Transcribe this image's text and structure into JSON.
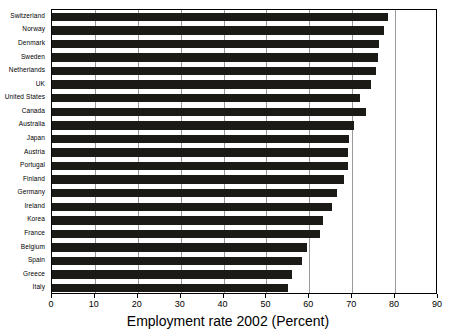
{
  "chart_data": {
    "type": "bar",
    "orientation": "horizontal",
    "title": "",
    "xlabel": "Employment rate 2002 (Percent)",
    "ylabel": "",
    "xlim": [
      0,
      90
    ],
    "xticks": [
      0,
      10,
      20,
      30,
      40,
      50,
      60,
      70,
      80,
      90
    ],
    "xtick_labels": [
      "0",
      "10",
      "20",
      "30",
      "40",
      "50",
      "60",
      "70",
      "80",
      "90"
    ],
    "grid": "vertical",
    "legend": null,
    "bar_color": "#1c1a17",
    "categories": [
      "Switzerland",
      "Norway",
      "Denmark",
      "Sweden",
      "Netherlands",
      "UK",
      "United States",
      "Canada",
      "Australia",
      "Japan",
      "Austria",
      "Portugal",
      "Finland",
      "Germany",
      "Ireland",
      "Korea",
      "France",
      "Belgium",
      "Spain",
      "Greece",
      "Italy"
    ],
    "values": [
      78.4,
      77.3,
      76.2,
      76.0,
      75.5,
      74.3,
      71.8,
      73.1,
      70.5,
      69.2,
      69.1,
      69.1,
      68.1,
      66.5,
      65.4,
      63.3,
      62.6,
      59.4,
      58.4,
      55.9,
      55.1
    ]
  }
}
